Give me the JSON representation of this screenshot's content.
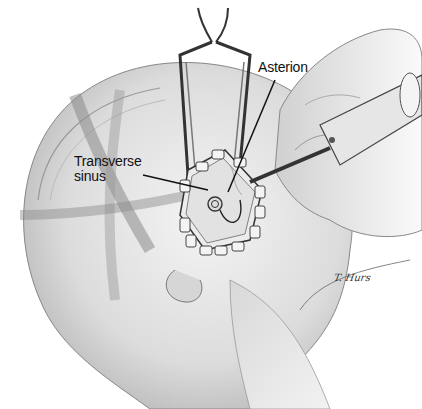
{
  "figure": {
    "labels": [
      {
        "id": "asterion",
        "text": "Asterion"
      },
      {
        "id": "transverse_sinus",
        "lines": [
          "Transverse",
          "sinus"
        ]
      }
    ],
    "signature": "T. Hurs",
    "colors": {
      "background": "#ffffff",
      "skin_shade": "#cfcfcf",
      "line": "#222222"
    }
  }
}
